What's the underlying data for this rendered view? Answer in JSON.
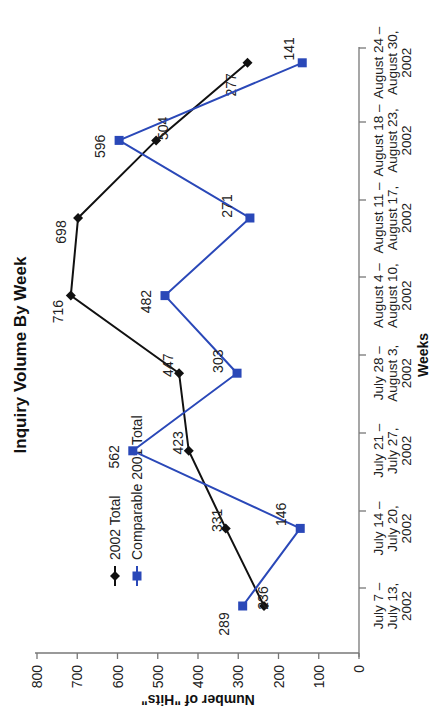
{
  "chart_data": {
    "type": "line",
    "title": "Inquiry Volume By Week",
    "xlabel": "Weeks",
    "ylabel": "Number of \"Hits\"",
    "ylim": [
      0,
      800
    ],
    "yticks": [
      0,
      100,
      200,
      300,
      400,
      500,
      600,
      700,
      800
    ],
    "grid": false,
    "legend_position": "upper-left",
    "orientation_note": "figure rotated 90 degrees counter-clockwise",
    "categories": [
      [
        "July 7 –",
        "July 13,",
        "2002"
      ],
      [
        "July 14 –",
        "July 20,",
        "2002"
      ],
      [
        "July 21 –",
        "July 27,",
        "2002"
      ],
      [
        "July 28 –",
        "August 3,",
        "2002"
      ],
      [
        "August 4 –",
        "August 10,",
        "2002"
      ],
      [
        "August 11 –",
        "August 17,",
        "2002"
      ],
      [
        "August 18 –",
        "August 23,",
        "2002"
      ],
      [
        "August 24 –",
        "August 30,",
        "2002"
      ]
    ],
    "series": [
      {
        "name": "2002 Total",
        "color": "#111111",
        "marker": "diamond",
        "values": [
          236,
          331,
          423,
          447,
          716,
          698,
          504,
          277
        ]
      },
      {
        "name": "Comparable 2001 Total",
        "color": "#2a48b8",
        "marker": "square",
        "values": [
          289,
          146,
          562,
          303,
          482,
          271,
          596,
          141
        ]
      }
    ]
  }
}
